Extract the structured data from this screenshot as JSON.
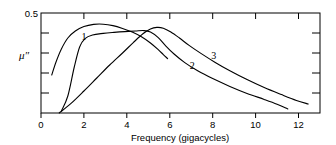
{
  "chart_data": {
    "type": "line",
    "title": "",
    "xlabel": "Frequency (gigacycles)",
    "ylabel": "μ″",
    "xlim": [
      0,
      13
    ],
    "ylim": [
      0,
      0.5
    ],
    "xticks": [
      0,
      2,
      4,
      6,
      8,
      10,
      12
    ],
    "xtick_labels": [
      "0",
      "2",
      "4",
      "6",
      "8",
      "10",
      "12"
    ],
    "yticks": [
      0,
      0.1,
      0.2,
      0.3,
      0.4,
      0.5
    ],
    "ytick_labels": [
      "",
      "",
      "",
      "",
      "",
      "0.5"
    ],
    "grid": false,
    "legend": "inline-curve-labels",
    "series": [
      {
        "name": "1",
        "label": "1",
        "label_x": 2.0,
        "label_y": 0.365,
        "points": [
          [
            0.5,
            0.19
          ],
          [
            0.7,
            0.255
          ],
          [
            0.95,
            0.32
          ],
          [
            1.25,
            0.375
          ],
          [
            1.6,
            0.41
          ],
          [
            2.0,
            0.432
          ],
          [
            2.45,
            0.443
          ],
          [
            2.9,
            0.444
          ],
          [
            3.35,
            0.437
          ],
          [
            3.8,
            0.423
          ],
          [
            4.25,
            0.405
          ],
          [
            4.7,
            0.38
          ],
          [
            5.1,
            0.35
          ],
          [
            5.45,
            0.318
          ],
          [
            5.7,
            0.292
          ],
          [
            5.9,
            0.272
          ]
        ]
      },
      {
        "name": "2",
        "label": "2",
        "label_x": 7.05,
        "label_y": 0.22,
        "points": [
          [
            0.95,
            0.01
          ],
          [
            1.25,
            0.085
          ],
          [
            1.55,
            0.23
          ],
          [
            1.8,
            0.33
          ],
          [
            2.05,
            0.372
          ],
          [
            2.4,
            0.39
          ],
          [
            2.9,
            0.398
          ],
          [
            3.4,
            0.403
          ],
          [
            3.9,
            0.407
          ],
          [
            4.4,
            0.41
          ],
          [
            4.8,
            0.412
          ],
          [
            5.1,
            0.405
          ],
          [
            5.45,
            0.378
          ],
          [
            5.8,
            0.337
          ],
          [
            6.2,
            0.295
          ],
          [
            6.7,
            0.252
          ],
          [
            7.3,
            0.211
          ],
          [
            8.0,
            0.172
          ],
          [
            8.8,
            0.133
          ],
          [
            9.6,
            0.098
          ],
          [
            10.4,
            0.068
          ],
          [
            11.0,
            0.044
          ],
          [
            11.5,
            0.02
          ]
        ]
      },
      {
        "name": "3",
        "label": "3",
        "label_x": 8.05,
        "label_y": 0.272,
        "points": [
          [
            0.85,
            0.0
          ],
          [
            1.4,
            0.048
          ],
          [
            2.0,
            0.11
          ],
          [
            2.6,
            0.175
          ],
          [
            3.2,
            0.24
          ],
          [
            3.8,
            0.3
          ],
          [
            4.3,
            0.352
          ],
          [
            4.75,
            0.396
          ],
          [
            5.1,
            0.42
          ],
          [
            5.4,
            0.428
          ],
          [
            5.7,
            0.424
          ],
          [
            6.05,
            0.405
          ],
          [
            6.45,
            0.375
          ],
          [
            6.9,
            0.338
          ],
          [
            7.45,
            0.298
          ],
          [
            8.1,
            0.254
          ],
          [
            8.8,
            0.211
          ],
          [
            9.6,
            0.167
          ],
          [
            10.4,
            0.127
          ],
          [
            11.2,
            0.092
          ],
          [
            11.9,
            0.063
          ],
          [
            12.45,
            0.045
          ]
        ]
      }
    ]
  },
  "axes": {
    "x_axis_title": "Frequency (gigacycles)",
    "y_axis_title": "μ″",
    "y_top_label": "0.5",
    "x_labels": [
      "0",
      "2",
      "4",
      "6",
      "8",
      "10",
      "12"
    ]
  },
  "curve_labels": {
    "one": "1",
    "two": "2",
    "three": "3"
  }
}
